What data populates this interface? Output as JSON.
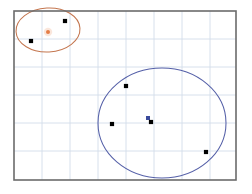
{
  "figure": {
    "name": "cluster-scatter-plot",
    "width": 252,
    "height": 194,
    "background": "#ffffff"
  },
  "colors": {
    "frame": "#6b6b6b",
    "grid": "#d3dcea",
    "point": "#000000",
    "cluster_a_outline": "#c4764f",
    "cluster_a_centroid": "#e06a2b",
    "cluster_b_outline": "#5560a8",
    "cluster_b_centroid": "#3a4a9c"
  },
  "plot_area": {
    "left": 14,
    "top": 11,
    "right": 236,
    "bottom": 180,
    "border_width": 1.6
  },
  "grid": {
    "visible": true,
    "x_lines": [
      42,
      70,
      98,
      126,
      154,
      182,
      210
    ],
    "y_lines": [
      39,
      67,
      95,
      123,
      151
    ]
  },
  "chart_data": {
    "type": "scatter",
    "title": "",
    "subtitle": "",
    "xlabel": "",
    "ylabel": "",
    "xlim": [
      0,
      8
    ],
    "ylim": [
      0,
      6
    ],
    "grid": true,
    "legend": "none",
    "axis_ticks": false,
    "tick_labels": [],
    "series": [
      {
        "name": "data-points",
        "marker": "square",
        "marker_size": 4.2,
        "color": "#000000",
        "points": [
          {
            "id": "p1",
            "px": 65,
            "py": 21,
            "x": 1.84,
            "y": 5.3
          },
          {
            "id": "p2",
            "px": 31,
            "py": 41,
            "x": 0.61,
            "y": 4.59
          },
          {
            "id": "p3",
            "px": 126,
            "py": 86,
            "x": 4.04,
            "y": 3.0
          },
          {
            "id": "p4",
            "px": 112,
            "py": 124,
            "x": 3.53,
            "y": 1.65
          },
          {
            "id": "p5",
            "px": 151,
            "py": 122,
            "x": 4.94,
            "y": 1.72
          },
          {
            "id": "p6",
            "px": 206,
            "py": 152,
            "x": 6.92,
            "y": 0.66
          }
        ]
      }
    ],
    "clusters": [
      {
        "id": "cluster-a",
        "label": "cluster-a",
        "outline_color": "#c4764f",
        "centroid_color": "#e06a2b",
        "centroid": {
          "px": 48,
          "py": 32,
          "x": 1.23,
          "y": 4.91
        },
        "ellipse": {
          "cx": 48,
          "cy": 30,
          "rx": 32,
          "ry": 22,
          "rotation": -3
        },
        "member_ids": [
          "p1",
          "p2"
        ],
        "member_count": 2
      },
      {
        "id": "cluster-b",
        "label": "cluster-b",
        "outline_color": "#5560a8",
        "centroid_color": "#3a4a9c",
        "centroid": {
          "px": 148,
          "py": 118,
          "x": 4.83,
          "y": 1.86
        },
        "ellipse": {
          "cx": 162,
          "cy": 123,
          "rx": 64,
          "ry": 55,
          "rotation": 0
        },
        "member_ids": [
          "p3",
          "p4",
          "p5",
          "p6"
        ],
        "member_count": 4
      }
    ],
    "annotations": []
  }
}
